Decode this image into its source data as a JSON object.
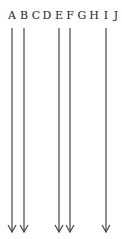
{
  "labels": [
    {
      "text": "A",
      "x": 12
    },
    {
      "text": "B",
      "x": 24
    },
    {
      "text": "C",
      "x": 36
    },
    {
      "text": "D",
      "x": 47
    },
    {
      "text": "E",
      "x": 59
    },
    {
      "text": "F",
      "x": 70
    },
    {
      "text": "G",
      "x": 82
    },
    {
      "text": "H",
      "x": 94
    },
    {
      "text": "I",
      "x": 106
    },
    {
      "text": "J",
      "x": 116
    }
  ],
  "arrows": [
    {
      "from": "A",
      "x": 12
    },
    {
      "from": "B",
      "x": 24
    },
    {
      "from": "E",
      "x": 59
    },
    {
      "from": "F",
      "x": 70
    },
    {
      "from": "I",
      "x": 106
    }
  ],
  "arrow_color": "#444444"
}
